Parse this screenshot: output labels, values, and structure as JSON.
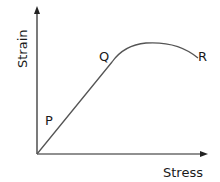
{
  "diagram": {
    "y_axis_label": "Strain",
    "x_axis_label": "Stress",
    "points": [
      {
        "label": "P"
      },
      {
        "label": "Q"
      },
      {
        "label": "R"
      }
    ],
    "line_color": "#555555",
    "axis_color": "#222222"
  }
}
